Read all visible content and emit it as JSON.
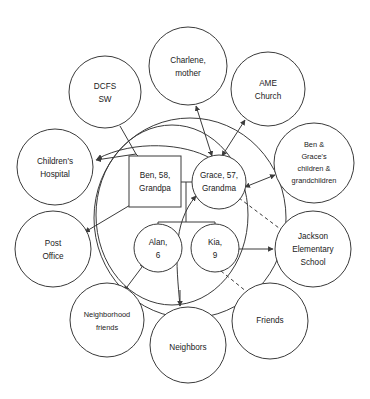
{
  "diagram": {
    "type": "ecomap-genogram",
    "title": "",
    "legend": {
      "solid_arrow": "strong / active connection",
      "double_headed_arrow": "reciprocal connection",
      "dashed_line": "tenuous connection"
    }
  },
  "household": {
    "boundary_label": "",
    "members": [
      {
        "id": "ben",
        "label": "Ben, 58,\nGrandpa",
        "line1": "Ben, 58,",
        "line2": "Grandpa",
        "shape": "square",
        "cx": 155,
        "cy": 182,
        "size": 51
      },
      {
        "id": "grace",
        "label": "Grace, 57,\nGrandma",
        "line1": "Grace, 57,",
        "line2": "Grandma",
        "shape": "circle",
        "cx": 219,
        "cy": 182,
        "r": 27
      },
      {
        "id": "alan",
        "label": "Alan,\n6",
        "line1": "Alan,",
        "line2": "6",
        "shape": "circle",
        "cx": 158,
        "cy": 248,
        "r": 24
      },
      {
        "id": "kia",
        "label": "Kia,\n9",
        "line1": "Kia,",
        "line2": "9",
        "shape": "circle",
        "cx": 215,
        "cy": 248,
        "r": 24
      }
    ]
  },
  "external_nodes": [
    {
      "id": "dcfs",
      "lines": [
        "DCFS",
        "SW"
      ],
      "cx": 105,
      "cy": 92,
      "r": 36
    },
    {
      "id": "charlene",
      "lines": [
        "Charlene,",
        "mother"
      ],
      "cx": 188,
      "cy": 66,
      "r": 39
    },
    {
      "id": "ame",
      "lines": [
        "AME",
        "Church"
      ],
      "cx": 268,
      "cy": 89,
      "r": 37
    },
    {
      "id": "bengrace",
      "lines": [
        "Ben &",
        "Grace's",
        "children &",
        "grandchildren"
      ],
      "cx": 314,
      "cy": 163,
      "r": 40
    },
    {
      "id": "hospital",
      "lines": [
        "Children's",
        "Hospital"
      ],
      "cx": 55,
      "cy": 167,
      "r": 38
    },
    {
      "id": "postoffice",
      "lines": [
        "Post",
        "Office"
      ],
      "cx": 53,
      "cy": 249,
      "r": 38
    },
    {
      "id": "jackson",
      "lines": [
        "Jackson",
        "Elementary",
        "School"
      ],
      "cx": 313,
      "cy": 249,
      "r": 38
    },
    {
      "id": "nbhdfriends",
      "lines": [
        "Neighborhood",
        "friends"
      ],
      "cx": 107,
      "cy": 320,
      "r": 37
    },
    {
      "id": "neighbors",
      "lines": [
        "Neighbors"
      ],
      "cx": 188,
      "cy": 345,
      "r": 38
    },
    {
      "id": "friends",
      "lines": [
        "Friends"
      ],
      "cx": 270,
      "cy": 321,
      "r": 38
    }
  ],
  "connections": [
    {
      "from": "dcfs",
      "to": "hospital",
      "style": "solid",
      "arrows": "single"
    },
    {
      "from": "dcfs",
      "to": "ben",
      "style": "solid",
      "arrows": "single"
    },
    {
      "from": "charlene",
      "to": "grace",
      "style": "solid",
      "arrows": "double"
    },
    {
      "from": "ame",
      "to": "grace",
      "style": "solid",
      "arrows": "double"
    },
    {
      "from": "bengrace",
      "to": "grace",
      "style": "solid",
      "arrows": "double"
    },
    {
      "from": "hospital",
      "to": "ben",
      "style": "solid",
      "arrows": "single"
    },
    {
      "from": "postoffice",
      "to": "ben",
      "style": "solid",
      "arrows": "double"
    },
    {
      "from": "nbhdfriends",
      "to": "alan",
      "style": "solid",
      "arrows": "double"
    },
    {
      "from": "grace",
      "to": "neighbors",
      "style": "solid",
      "arrows": "single"
    },
    {
      "from": "kia",
      "to": "jackson",
      "style": "solid",
      "arrows": "single"
    },
    {
      "from": "grace",
      "to": "jackson",
      "style": "dashed",
      "arrows": "none"
    },
    {
      "from": "kia",
      "to": "friends",
      "style": "dashed",
      "arrows": "none"
    }
  ]
}
